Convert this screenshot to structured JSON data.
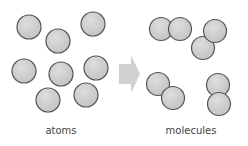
{
  "diagram": {
    "atoms_label": "atoms",
    "molecules_label": "molecules",
    "arrow": "right-arrow",
    "atom_count": 8,
    "molecule_count": 4,
    "colors": {
      "atom_fill": "#cfcfcf",
      "atom_stroke": "#555555",
      "arrow": "#d0d0d0"
    }
  }
}
